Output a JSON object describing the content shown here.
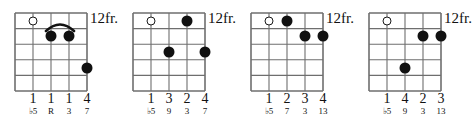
{
  "page": {
    "kind": "guitar-chord-diagram-row",
    "diagram_count": 4,
    "ink_color": "#111111",
    "grid_color": "#6e6e6e",
    "background": "#ffffff",
    "strings": 5,
    "frets": 5
  },
  "diagrams": [
    {
      "id": "chord-1",
      "fret_label": "12fr.",
      "open_strings": [
        {
          "string": 2,
          "fret": 1
        }
      ],
      "dots": [
        {
          "string": 3,
          "fret": 2
        },
        {
          "string": 4,
          "fret": 2
        },
        {
          "string": 5,
          "fret": 4
        }
      ],
      "barre": {
        "from_string": 3,
        "to_string": 4,
        "fret": 2
      },
      "fingers": [
        "1",
        "1",
        "1",
        "4"
      ],
      "finger_strings": [
        2,
        3,
        4,
        5
      ],
      "intervals": [
        "♭5",
        "R",
        "3",
        "7"
      ],
      "interval_strings": [
        2,
        3,
        4,
        5
      ]
    },
    {
      "id": "chord-2",
      "fret_label": "12fr.",
      "open_strings": [
        {
          "string": 2,
          "fret": 1
        }
      ],
      "dots": [
        {
          "string": 4,
          "fret": 1
        },
        {
          "string": 3,
          "fret": 3
        },
        {
          "string": 5,
          "fret": 3
        }
      ],
      "barre": null,
      "fingers": [
        "1",
        "3",
        "2",
        "4"
      ],
      "finger_strings": [
        2,
        3,
        4,
        5
      ],
      "intervals": [
        "♭5",
        "9",
        "3",
        "7"
      ],
      "interval_strings": [
        2,
        3,
        4,
        5
      ]
    },
    {
      "id": "chord-3",
      "fret_label": "12fr.",
      "open_strings": [
        {
          "string": 2,
          "fret": 1
        }
      ],
      "dots": [
        {
          "string": 3,
          "fret": 1
        },
        {
          "string": 4,
          "fret": 2
        },
        {
          "string": 5,
          "fret": 2
        }
      ],
      "barre": null,
      "fingers": [
        "1",
        "2",
        "3",
        "4"
      ],
      "finger_strings": [
        2,
        3,
        4,
        5
      ],
      "intervals": [
        "♭5",
        "7",
        "3",
        "13"
      ],
      "interval_strings": [
        2,
        3,
        4,
        5
      ]
    },
    {
      "id": "chord-4",
      "fret_label": "12fr.",
      "open_strings": [
        {
          "string": 2,
          "fret": 1
        }
      ],
      "dots": [
        {
          "string": 4,
          "fret": 2
        },
        {
          "string": 5,
          "fret": 2
        },
        {
          "string": 3,
          "fret": 4
        }
      ],
      "barre": null,
      "fingers": [
        "1",
        "4",
        "2",
        "3"
      ],
      "finger_strings": [
        2,
        3,
        4,
        5
      ],
      "intervals": [
        "♭5",
        "9",
        "3",
        "13"
      ],
      "interval_strings": [
        2,
        3,
        4,
        5
      ]
    }
  ]
}
